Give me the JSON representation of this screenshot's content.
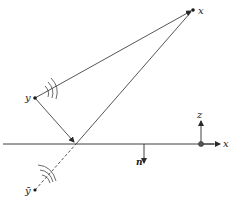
{
  "diagram": {
    "type": "reflection-geometry",
    "labels": {
      "receiver": "x",
      "source": "y",
      "image_source": "ȳ",
      "normal": "n",
      "axis_z": "z",
      "axis_x": "x"
    },
    "points": {
      "receiver": [
        193,
        10
      ],
      "source": [
        35,
        98
      ],
      "reflection": [
        76,
        144
      ],
      "image_source": [
        35,
        190
      ],
      "origin": [
        201,
        144
      ]
    },
    "surface": {
      "y": 144,
      "x_start": 3,
      "x_end": 215
    },
    "colors": {
      "line": "#2a2a2a",
      "background": "#ffffff"
    }
  }
}
